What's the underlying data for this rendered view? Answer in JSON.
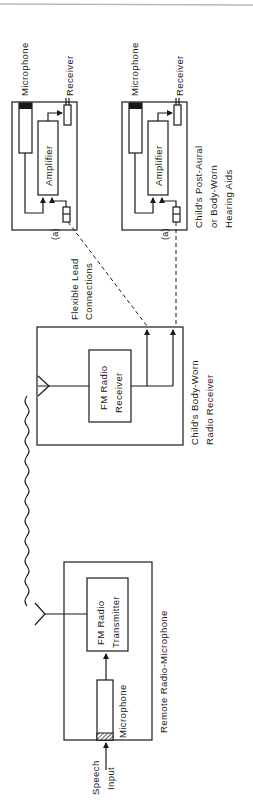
{
  "diagram": {
    "type": "block-diagram",
    "orientation": "rotated-90-ccw",
    "colors": {
      "line": "#1a1a1a",
      "background": "#ffffff",
      "top_rule": "#b8b8b8"
    },
    "hearing_aids": [
      {
        "microphone_label": "Microphone",
        "receiver_label": "Receiver",
        "amplifier_label": "Amplifier",
        "connector_label": "(a)"
      },
      {
        "microphone_label": "Microphone",
        "receiver_label": "Receiver",
        "amplifier_label": "Amplifier",
        "connector_label": "(a)"
      }
    ],
    "hearing_aids_caption": [
      "Child's Post-Aural",
      "or Body-Worn",
      "Hearing Aids"
    ],
    "flexible_leads_caption": [
      "Flexible Lead",
      "Connections"
    ],
    "body_receiver": {
      "block_label": [
        "FM Radio",
        "Receiver"
      ],
      "caption": [
        "Child's Body-Worn",
        "Radio Receiver"
      ]
    },
    "transmitter": {
      "block_label": [
        "FM Radio",
        "Transmitter"
      ],
      "microphone_label": "Microphone",
      "caption": "Remote Radio-Microphone"
    },
    "speech_input_label": [
      "Speech",
      "Input"
    ],
    "icons": {
      "antenna": "antenna-icon",
      "radio_wave": "radio-wave-icon",
      "arrow": "arrow-icon"
    }
  }
}
